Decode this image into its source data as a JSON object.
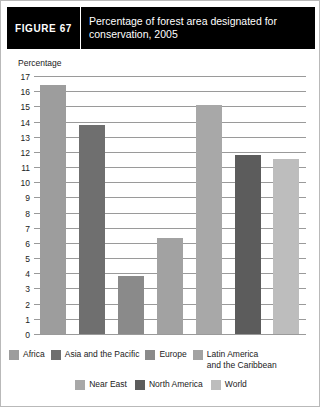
{
  "header": {
    "tag": "FIGURE  67",
    "title": "Percentage of forest area designated for conservation, 2005"
  },
  "chart_data": {
    "type": "bar",
    "title": "Percentage of forest area designated for conservation, 2005",
    "xlabel": "",
    "ylabel": "Percentage",
    "ylim": [
      0,
      17
    ],
    "yticks": [
      17,
      16,
      15,
      14,
      13,
      12,
      11,
      10,
      9,
      8,
      7,
      6,
      5,
      4,
      3,
      2,
      1,
      0
    ],
    "grid": true,
    "legend_position": "bottom",
    "categories": [
      "Africa",
      "Asia and the Pacific",
      "Europe",
      "Latin America and the Caribbean",
      "Near East",
      "North America",
      "World"
    ],
    "values": [
      16.4,
      13.8,
      3.8,
      6.3,
      15.1,
      11.8,
      11.5
    ],
    "colors": [
      "#9d9d9d",
      "#6f6f6f",
      "#8a8a8a",
      "#a2a2a2",
      "#a8a8a8",
      "#5c5c5c",
      "#bdbdbd"
    ]
  },
  "legend": {
    "row1": [
      {
        "label": "Africa",
        "color": "#9d9d9d"
      },
      {
        "label": "Asia and the Pacific",
        "color": "#6f6f6f"
      },
      {
        "label": "Europe",
        "color": "#8a8a8a"
      },
      {
        "label": "Latin America\nand the Caribbean",
        "color": "#a2a2a2"
      }
    ],
    "row2": [
      {
        "label": "Near East",
        "color": "#a8a8a8"
      },
      {
        "label": "North America",
        "color": "#5c5c5c"
      },
      {
        "label": "World",
        "color": "#bdbdbd"
      }
    ]
  }
}
